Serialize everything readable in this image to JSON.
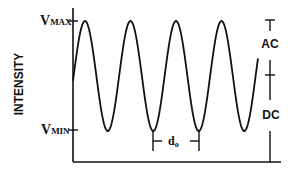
{
  "diagram": {
    "title": "",
    "y_axis_label": "INTENSITY",
    "vmax_label": {
      "main": "V",
      "sub": "MAX"
    },
    "vmin_label": {
      "main": "V",
      "sub": "MIN"
    },
    "ac_label": "AC",
    "dc_label": "DC",
    "period_label": {
      "main": "d",
      "sub": "o"
    },
    "colors": {
      "line": "#111111",
      "background": "#ffffff"
    },
    "waveform": {
      "type": "sinusoid",
      "x_start": 73,
      "x_end": 258,
      "y_max": 21,
      "y_min": 131,
      "period_px": 45.5,
      "first_peak_x": 85
    }
  }
}
